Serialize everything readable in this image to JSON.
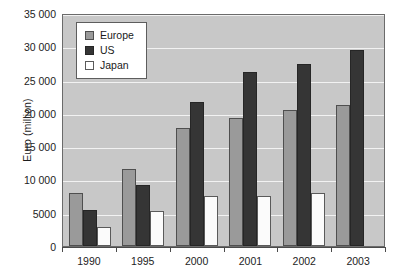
{
  "chart_data": {
    "type": "bar",
    "title": "",
    "xlabel": "",
    "ylabel": "Euro (million)",
    "categories": [
      "1990",
      "1995",
      "2000",
      "2001",
      "2002",
      "2003"
    ],
    "series": [
      {
        "name": "Europe",
        "color": "#9a9a9a",
        "values": [
          8000,
          11500,
          17800,
          19300,
          20500,
          21200
        ]
      },
      {
        "name": "US",
        "color": "#353535",
        "values": [
          5400,
          9200,
          21700,
          26200,
          27300,
          29400
        ]
      },
      {
        "name": "Japan",
        "color": "#ffffff",
        "values": [
          2900,
          5200,
          7500,
          7500,
          8000,
          null
        ]
      }
    ],
    "ylim": [
      0,
      35000
    ],
    "ytick_values": [
      0,
      5000,
      10000,
      15000,
      20000,
      25000,
      30000,
      35000
    ],
    "ytick_labels": [
      "0",
      "5000",
      "10 000",
      "15 000",
      "20 000",
      "25 000",
      "30 000",
      "35 000"
    ],
    "grid": true,
    "legend_position": "top-left",
    "plot_background": "#c8c8c8",
    "gridline_color": "#f2f2f2",
    "axis_color": "#4a4a4a"
  },
  "legend": {
    "entries": [
      {
        "label": "Europe",
        "swatch": "europe"
      },
      {
        "label": "US",
        "swatch": "us"
      },
      {
        "label": "Japan",
        "swatch": "japan"
      }
    ]
  }
}
